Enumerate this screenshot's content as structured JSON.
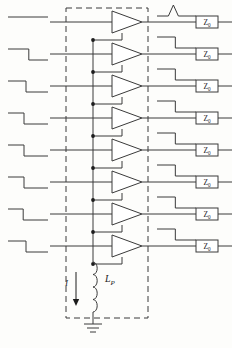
{
  "figure": {
    "kind": "circuit-schematic",
    "line_color": "#3a3a3a",
    "background": "#fdfdfb"
  },
  "geometry": {
    "width": 232,
    "height": 348,
    "row_count": 8,
    "row_y": [
      22,
      54,
      86,
      118,
      150,
      182,
      214,
      246
    ],
    "input_line_x0": 66,
    "input_line_x1": 112,
    "amp_left_x": 112,
    "amp_tip_x": 142,
    "amp_half_height": 11,
    "bus_x": 93,
    "output_x0": 142,
    "output_x1": 196,
    "dashbox": {
      "x": 66,
      "y": 8,
      "w": 82,
      "h": 310
    },
    "inductor": {
      "x": 93,
      "y_top": 262,
      "y_bottom": 312
    },
    "ground_y": 334
  },
  "blocks": {
    "amplifier_count": 8,
    "amplifier_name": "driver-triangle",
    "bus_dot_rows": [
      2,
      3,
      4,
      5,
      6,
      7,
      8
    ]
  },
  "labels": {
    "impedance": "Z",
    "impedance_subscript": "0",
    "current": "I",
    "inductor": "L",
    "inductor_subscript": "P"
  },
  "terminations": [
    {
      "index": 1,
      "label": "Z",
      "subscript": "0"
    },
    {
      "index": 2,
      "label": "Z",
      "subscript": "0"
    },
    {
      "index": 3,
      "label": "Z",
      "subscript": "0"
    },
    {
      "index": 4,
      "label": "Z",
      "subscript": "0"
    },
    {
      "index": 5,
      "label": "Z",
      "subscript": "0"
    },
    {
      "index": 6,
      "label": "Z",
      "subscript": "0"
    },
    {
      "index": 7,
      "label": "Z",
      "subscript": "0"
    },
    {
      "index": 8,
      "label": "Z",
      "subscript": "0"
    }
  ],
  "input_waveforms": [
    {
      "index": 1,
      "shape": "flat",
      "edge_fraction": 1.0
    },
    {
      "index": 2,
      "shape": "falling-step",
      "edge_fraction": 0.52
    },
    {
      "index": 3,
      "shape": "falling-step",
      "edge_fraction": 0.45
    },
    {
      "index": 4,
      "shape": "falling-step",
      "edge_fraction": 0.4
    },
    {
      "index": 5,
      "shape": "falling-step",
      "edge_fraction": 0.4
    },
    {
      "index": 6,
      "shape": "falling-step",
      "edge_fraction": 0.4
    },
    {
      "index": 7,
      "shape": "falling-step",
      "edge_fraction": 0.38
    },
    {
      "index": 8,
      "shape": "falling-step",
      "edge_fraction": 0.45
    }
  ],
  "output_waveforms": [
    {
      "index": 1,
      "shape": "pulse",
      "edge_fraction": 0.42
    },
    {
      "index": 2,
      "shape": "falling-step",
      "edge_fraction": 0.47
    },
    {
      "index": 3,
      "shape": "falling-step",
      "edge_fraction": 0.47
    },
    {
      "index": 4,
      "shape": "falling-step",
      "edge_fraction": 0.47
    },
    {
      "index": 5,
      "shape": "falling-step",
      "edge_fraction": 0.47
    },
    {
      "index": 6,
      "shape": "falling-step",
      "edge_fraction": 0.47
    },
    {
      "index": 7,
      "shape": "falling-step",
      "edge_fraction": 0.47
    },
    {
      "index": 8,
      "shape": "falling-step",
      "edge_fraction": 0.47
    }
  ]
}
